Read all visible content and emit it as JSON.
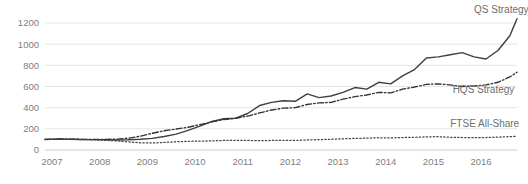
{
  "chart_data": {
    "type": "line",
    "title": "",
    "subtitle": "",
    "xlabel": "",
    "ylabel": "",
    "grid": true,
    "legend_position": "inline-right",
    "xlim": [
      2007.0,
      2016.9
    ],
    "ylim": [
      0,
      1200
    ],
    "y_ticks": [
      0,
      200,
      400,
      600,
      800,
      1000,
      1200
    ],
    "x_ticks": [
      "2007",
      "2008",
      "2009",
      "2010",
      "2011",
      "2012",
      "2013",
      "2014",
      "2015",
      "2016"
    ],
    "x": [
      2007.0,
      2007.25,
      2007.5,
      2007.75,
      2008.0,
      2008.25,
      2008.5,
      2008.75,
      2009.0,
      2009.25,
      2009.5,
      2009.75,
      2010.0,
      2010.25,
      2010.5,
      2010.75,
      2011.0,
      2011.25,
      2011.5,
      2011.75,
      2012.0,
      2012.25,
      2012.5,
      2012.75,
      2013.0,
      2013.25,
      2013.5,
      2013.75,
      2014.0,
      2014.25,
      2014.5,
      2014.75,
      2015.0,
      2015.25,
      2015.5,
      2015.75,
      2016.0,
      2016.25,
      2016.5,
      2016.75,
      2016.9
    ],
    "series": [
      {
        "name": "QS Strategy",
        "style": "solid",
        "color": "#404040",
        "label_x": 2016.0,
        "label_y": 1290,
        "values": [
          100,
          103,
          101,
          99,
          98,
          96,
          95,
          97,
          102,
          110,
          128,
          150,
          185,
          225,
          270,
          295,
          300,
          345,
          420,
          450,
          465,
          460,
          530,
          495,
          510,
          545,
          590,
          575,
          640,
          625,
          700,
          760,
          870,
          880,
          900,
          920,
          880,
          860,
          940,
          1080,
          1240
        ]
      },
      {
        "name": "HQS Strategy",
        "style": "dashdot",
        "color": "#333333",
        "label_x": 2015.55,
        "label_y": 540,
        "values": [
          100,
          104,
          103,
          101,
          100,
          101,
          103,
          112,
          130,
          158,
          182,
          198,
          215,
          240,
          265,
          288,
          300,
          320,
          350,
          378,
          395,
          400,
          430,
          445,
          450,
          480,
          505,
          520,
          545,
          540,
          575,
          595,
          620,
          625,
          615,
          600,
          605,
          615,
          640,
          690,
          735
        ]
      },
      {
        "name": "FTSE All-Share",
        "style": "dotted",
        "color": "#444444",
        "label_x": 2015.5,
        "label_y": 215,
        "values": [
          100,
          102,
          101,
          99,
          96,
          92,
          86,
          76,
          68,
          66,
          72,
          78,
          82,
          84,
          86,
          90,
          92,
          90,
          88,
          90,
          92,
          91,
          95,
          98,
          102,
          106,
          110,
          112,
          116,
          114,
          118,
          120,
          124,
          126,
          120,
          118,
          116,
          118,
          122,
          126,
          130
        ]
      }
    ]
  },
  "axes": {
    "y_axis_name": "value-axis",
    "x_axis_name": "year-axis"
  }
}
